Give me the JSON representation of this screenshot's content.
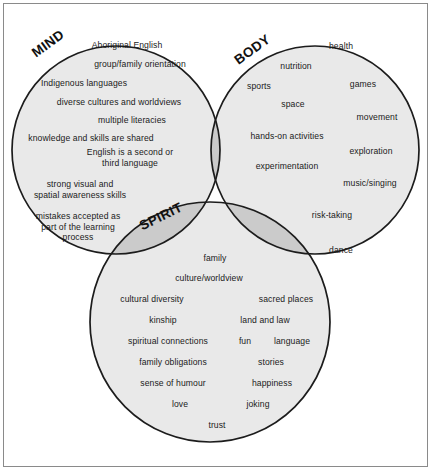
{
  "figure": {
    "type": "venn-diagram",
    "sets": 3,
    "background": "#ffffff",
    "frame_color": "#8a8a8a",
    "circle_fill": "#e8e8e8",
    "circle_stroke": "#1a1a1a",
    "overlap_fill": "#c9c9c9",
    "center_fill": "#b4b4b4"
  },
  "circles": {
    "mind": {
      "title": "MIND"
    },
    "body": {
      "title": "BODY"
    },
    "spirit": {
      "title": "SPIRIT"
    }
  },
  "mind_items": [
    {
      "text": "Aboriginal English",
      "x": 127,
      "y": 45
    },
    {
      "text": "group/family orientation",
      "x": 140,
      "y": 64
    },
    {
      "text": "Indigenous languages",
      "x": 84,
      "y": 83
    },
    {
      "text": "diverse cultures and worldviews",
      "x": 119,
      "y": 102
    },
    {
      "text": "multiple literacies",
      "x": 132,
      "y": 120
    },
    {
      "text": "knowledge and skills are shared",
      "x": 91,
      "y": 138
    },
    {
      "text": "English is a second or\nthird language",
      "x": 130,
      "y": 158
    },
    {
      "text": "strong visual and\nspatial awareness skills",
      "x": 80,
      "y": 190
    },
    {
      "text": "mistakes accepted as\npart of the learning\nprocess",
      "x": 78,
      "y": 227
    }
  ],
  "body_items": [
    {
      "text": "health",
      "x": 341,
      "y": 46
    },
    {
      "text": "nutrition",
      "x": 296,
      "y": 66
    },
    {
      "text": "sports",
      "x": 259,
      "y": 86
    },
    {
      "text": "games",
      "x": 363,
      "y": 84
    },
    {
      "text": "space",
      "x": 293,
      "y": 104
    },
    {
      "text": "movement",
      "x": 377,
      "y": 117
    },
    {
      "text": "hands-on activities",
      "x": 287,
      "y": 136
    },
    {
      "text": "exploration",
      "x": 371,
      "y": 151
    },
    {
      "text": "experimentation",
      "x": 287,
      "y": 166
    },
    {
      "text": "music/singing",
      "x": 370,
      "y": 183
    },
    {
      "text": "risk-taking",
      "x": 332,
      "y": 215
    },
    {
      "text": "dance",
      "x": 341,
      "y": 250
    }
  ],
  "spirit_items": [
    {
      "text": "family",
      "x": 215,
      "y": 258
    },
    {
      "text": "culture/worldview",
      "x": 209,
      "y": 278
    },
    {
      "text": "cultural diversity",
      "x": 152,
      "y": 299
    },
    {
      "text": "sacred places",
      "x": 286,
      "y": 299
    },
    {
      "text": "kinship",
      "x": 163,
      "y": 320
    },
    {
      "text": "land and law",
      "x": 265,
      "y": 320
    },
    {
      "text": "spiritual connections",
      "x": 168,
      "y": 341
    },
    {
      "text": "fun",
      "x": 245,
      "y": 341
    },
    {
      "text": "language",
      "x": 292,
      "y": 341
    },
    {
      "text": "family obligations",
      "x": 173,
      "y": 362
    },
    {
      "text": "stories",
      "x": 271,
      "y": 362
    },
    {
      "text": "sense of humour",
      "x": 173,
      "y": 383
    },
    {
      "text": "happiness",
      "x": 272,
      "y": 383
    },
    {
      "text": "love",
      "x": 180,
      "y": 404
    },
    {
      "text": "joking",
      "x": 258,
      "y": 404
    },
    {
      "text": "trust",
      "x": 217,
      "y": 425
    }
  ]
}
